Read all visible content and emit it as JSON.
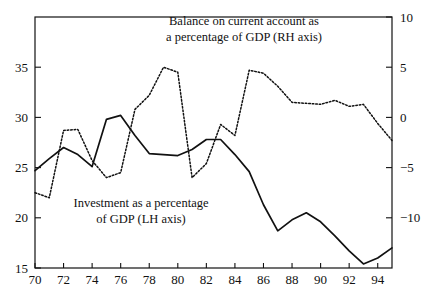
{
  "chart_data": {
    "type": "line",
    "title": "",
    "xlabel": "",
    "ylabel": "",
    "grid": false,
    "legend_position": "inline-annotations",
    "x": [
      70,
      71,
      72,
      73,
      74,
      75,
      76,
      77,
      78,
      79,
      80,
      81,
      82,
      83,
      84,
      85,
      86,
      87,
      88,
      89,
      90,
      91,
      92,
      93,
      94,
      95
    ],
    "xlim": [
      70,
      95
    ],
    "xticks": [
      70,
      72,
      74,
      76,
      78,
      80,
      82,
      84,
      86,
      88,
      90,
      92,
      94
    ],
    "xtick_labels": [
      "70",
      "72",
      "74",
      "76",
      "78",
      "80",
      "82",
      "84",
      "86",
      "88",
      "90",
      "92",
      "94"
    ],
    "left_axis": {
      "name": "LH axis",
      "label": "Investment as a percentage of GDP",
      "ylim": [
        15,
        40
      ],
      "yticks": [
        15,
        20,
        25,
        30,
        35
      ],
      "ytick_labels": [
        "15",
        "20",
        "25",
        "30",
        "35"
      ]
    },
    "right_axis": {
      "name": "RH axis",
      "label": "Balance on current account as a percentage of GDP",
      "ylim": [
        -15,
        10
      ],
      "yticks": [
        -10,
        -5,
        0,
        5,
        10
      ],
      "ytick_labels": [
        "−10",
        "−5",
        "0",
        "5",
        "10"
      ]
    },
    "series": [
      {
        "name": "Investment as a percentage of GDP (LH axis)",
        "axis": "left",
        "style": "solid",
        "color": "#111111",
        "values": [
          24.7,
          25.9,
          27.0,
          26.3,
          25.1,
          29.8,
          30.2,
          28.2,
          26.4,
          26.3,
          26.2,
          26.8,
          27.8,
          27.8,
          26.3,
          24.6,
          21.3,
          18.7,
          19.8,
          20.5,
          19.6,
          18.2,
          16.7,
          15.4,
          16.0,
          17.0
        ]
      },
      {
        "name": "Balance on current account as a percentage of GDP (RH axis)",
        "axis": "right",
        "style": "dotted",
        "color": "#111111",
        "values": [
          -7.5,
          -8.0,
          -1.3,
          -1.2,
          -4.3,
          -6.0,
          -5.5,
          0.8,
          2.2,
          5.0,
          4.5,
          -6.0,
          -4.6,
          -0.7,
          -1.8,
          4.7,
          4.4,
          3.1,
          1.5,
          1.4,
          1.3,
          1.7,
          1.1,
          1.3,
          -0.6,
          -2.3
        ]
      }
    ],
    "annotations": [
      {
        "id": "balance-annotation",
        "lines": [
          "Balance on current account as",
          "a percentage of GDP (RH axis)"
        ]
      },
      {
        "id": "investment-annotation",
        "lines": [
          "Investment as a percentage",
          "of GDP (LH axis)"
        ]
      }
    ]
  },
  "plot_geometry": {
    "left": 35,
    "right": 392,
    "top": 17,
    "bottom": 268
  }
}
